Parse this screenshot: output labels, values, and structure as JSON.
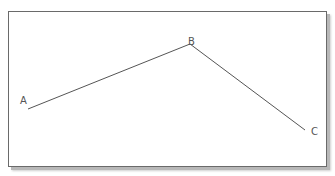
{
  "diagram": {
    "points": [
      {
        "label": "A",
        "x": 28,
        "y": 109,
        "label_x": 20,
        "label_y": 104
      },
      {
        "label": "B",
        "x": 190,
        "y": 44,
        "label_x": 188,
        "label_y": 45
      },
      {
        "label": "C",
        "x": 305,
        "y": 130,
        "label_x": 311,
        "label_y": 135
      }
    ],
    "segments": [
      [
        "A",
        "B"
      ],
      [
        "B",
        "C"
      ]
    ],
    "line_color": "#555555"
  }
}
